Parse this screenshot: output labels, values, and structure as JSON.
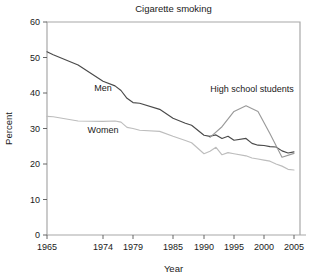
{
  "chart_data": {
    "type": "line",
    "title": "Cigarette smoking",
    "xlabel": "Year",
    "ylabel": "Percent",
    "xlim": [
      1965,
      2005
    ],
    "ylim": [
      0,
      60
    ],
    "grid": false,
    "legend": "inline-labels",
    "xticks": [
      1965,
      1974,
      1979,
      1985,
      1990,
      1995,
      2000,
      2005
    ],
    "xtick_labels": [
      "1965",
      "1974",
      "1979",
      "1985",
      "1990",
      "1995",
      "2000",
      "2005"
    ],
    "yticks": [
      0,
      10,
      20,
      30,
      40,
      50,
      60
    ],
    "ytick_labels": [
      "0",
      "10",
      "20",
      "30",
      "40",
      "50",
      "60"
    ],
    "series": [
      {
        "name": "Men",
        "color": "#4a4a4a",
        "label_x": 1974,
        "label_y": 41.5,
        "x": [
          1965,
          1966,
          1970,
          1974,
          1976,
          1977,
          1978,
          1979,
          1980,
          1983,
          1985,
          1987,
          1988,
          1990,
          1991,
          1992,
          1993,
          1994,
          1995,
          1997,
          1998,
          1999,
          2000,
          2001,
          2002,
          2003,
          2004,
          2005
        ],
        "values": [
          51.6,
          50.8,
          47.9,
          43.3,
          42.0,
          40.7,
          38.5,
          37.3,
          37.1,
          35.4,
          32.9,
          31.5,
          30.9,
          28.1,
          27.8,
          28.2,
          27.2,
          27.8,
          26.7,
          27.2,
          25.8,
          25.3,
          25.2,
          24.9,
          24.8,
          23.7,
          23.1,
          23.4
        ],
        "note": "Adult men, percent who smoke cigarettes"
      },
      {
        "name": "Women",
        "color": "#bdbdbd",
        "label_x": 1974,
        "label_y": 29.5,
        "x": [
          1965,
          1966,
          1970,
          1974,
          1976,
          1977,
          1978,
          1979,
          1980,
          1983,
          1985,
          1987,
          1988,
          1990,
          1991,
          1992,
          1993,
          1994,
          1995,
          1997,
          1998,
          1999,
          2000,
          2001,
          2002,
          2003,
          2004,
          2005
        ],
        "values": [
          33.4,
          33.3,
          32.1,
          32.0,
          32.1,
          31.8,
          30.3,
          30.0,
          29.5,
          29.2,
          27.8,
          26.6,
          26.0,
          22.9,
          23.6,
          24.7,
          22.6,
          23.2,
          22.9,
          22.3,
          21.7,
          21.4,
          21.1,
          20.8,
          20.0,
          19.4,
          18.5,
          18.3
        ]
      },
      {
        "name": "High school students",
        "color": "#9a9a9a",
        "label_x": 1998,
        "label_y": 41.0,
        "x": [
          1991,
          1993,
          1995,
          1997,
          1999,
          2001,
          2003,
          2005
        ],
        "values": [
          27.5,
          30.5,
          34.8,
          36.4,
          34.8,
          28.5,
          21.9,
          23.0
        ]
      }
    ]
  },
  "plot_geometry": {
    "left": 47,
    "right": 300,
    "top": 22,
    "bottom": 235
  }
}
